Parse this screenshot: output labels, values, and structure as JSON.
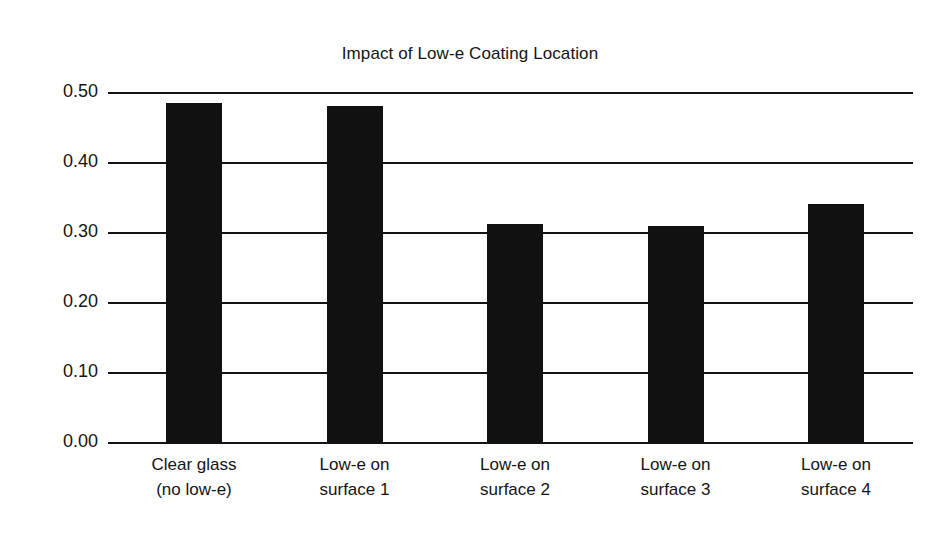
{
  "chart_data": {
    "type": "bar",
    "title": "Impact of Low-e Coating Location",
    "xlabel": "",
    "ylabel": "Center of Glass U-factor",
    "categories": [
      "Clear glass (no low-e)",
      "Low-e on surface 1",
      "Low-e on surface 2",
      "Low-e on surface 3",
      "Low-e on surface 4"
    ],
    "category_lines": [
      [
        "Clear glass",
        "(no low-e)"
      ],
      [
        "Low-e on",
        "surface 1"
      ],
      [
        "Low-e on",
        "surface 2"
      ],
      [
        "Low-e on",
        "surface 3"
      ],
      [
        "Low-e on",
        "surface 4"
      ]
    ],
    "values": [
      0.484,
      0.48,
      0.311,
      0.309,
      0.34
    ],
    "ylim": [
      0.0,
      0.5
    ],
    "ytick_values": [
      0.5,
      0.4,
      0.3,
      0.2,
      0.1,
      0.0
    ],
    "ytick_labels": [
      "0.50",
      "0.40",
      "0.30",
      "0.20",
      "0.10",
      "0.00"
    ],
    "grid": true,
    "legend": "none",
    "bar_color": "#111111",
    "grid_color": "#131313"
  }
}
